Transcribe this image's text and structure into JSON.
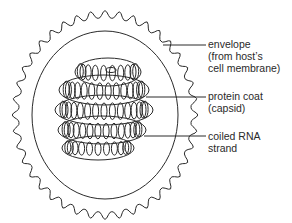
{
  "diagram": {
    "labels": [
      {
        "id": "envelope",
        "lines": [
          "envelope",
          "(from host’s",
          "cell membrane)"
        ]
      },
      {
        "id": "protein-coat",
        "lines": [
          "protein coat",
          "(capsid)"
        ]
      },
      {
        "id": "coiled-rna",
        "lines": [
          "coiled RNA",
          "strand"
        ]
      }
    ]
  }
}
